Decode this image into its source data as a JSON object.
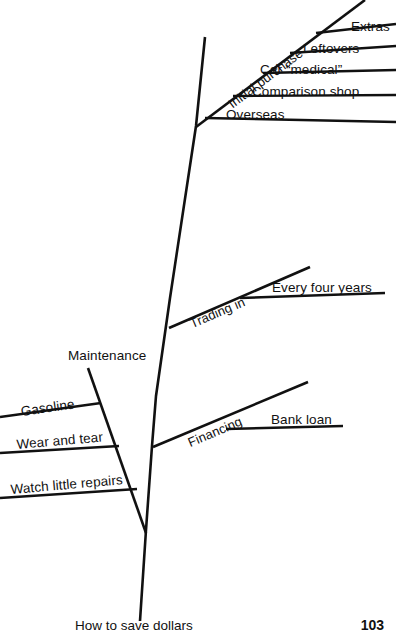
{
  "page": {
    "caption": "How to save dollars",
    "page_number": "103",
    "background_color": "#ffffff",
    "line_color": "#111111"
  },
  "diagram": {
    "type": "fishbone-tree",
    "spine_label": "How to save dollars",
    "branches": [
      {
        "id": "initial-purchase",
        "label": "Initial purchase",
        "side": "right",
        "sub_branches": [
          {
            "id": "extras",
            "label": "Extras"
          },
          {
            "id": "leftovers",
            "label": "Leftovers"
          },
          {
            "id": "car-medical",
            "label": "Car “medical”"
          },
          {
            "id": "comparison-shop",
            "label": "Comparison shop"
          },
          {
            "id": "overseas",
            "label": "Overseas"
          }
        ]
      },
      {
        "id": "trading-in",
        "label": "Trading in",
        "side": "right",
        "sub_branches": [
          {
            "id": "every-four-years",
            "label": "Every four years"
          }
        ]
      },
      {
        "id": "financing",
        "label": "Financing",
        "side": "right",
        "sub_branches": [
          {
            "id": "bank-loan",
            "label": "Bank loan"
          }
        ]
      },
      {
        "id": "maintenance",
        "label": "Maintenance",
        "side": "left",
        "sub_branches": [
          {
            "id": "gasoline",
            "label": "Gasoline"
          },
          {
            "id": "wear-and-tear",
            "label": "Wear and tear"
          },
          {
            "id": "watch-little-repairs",
            "label": "Watch little repairs"
          }
        ]
      }
    ]
  }
}
